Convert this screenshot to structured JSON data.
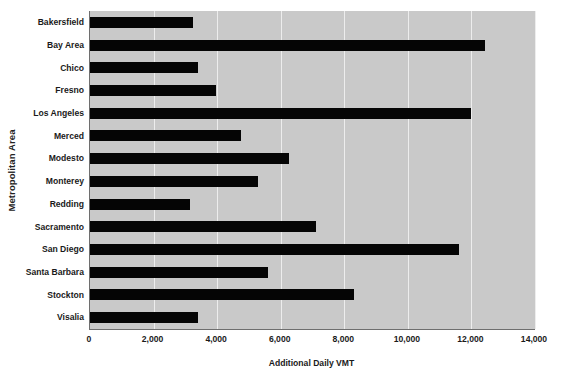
{
  "chart_data": {
    "type": "bar",
    "orientation": "horizontal",
    "title": "",
    "xlabel": "Additional Daily VMT",
    "ylabel": "Metropolitan Area",
    "xlim": [
      0,
      14000
    ],
    "xticks": [
      0,
      2000,
      4000,
      6000,
      8000,
      10000,
      12000,
      14000
    ],
    "xtick_labels": [
      "0",
      "2,000",
      "4,000",
      "6,000",
      "8,000",
      "10,000",
      "12,000",
      "14,000"
    ],
    "grid": true,
    "grid_axis": "x",
    "legend": false,
    "categories": [
      "Bakersfield",
      "Bay Area",
      "Chico",
      "Fresno",
      "Los Angeles",
      "Merced",
      "Modesto",
      "Monterey",
      "Redding",
      "Sacramento",
      "San Diego",
      "Santa Barbara",
      "Stockton",
      "Visalia"
    ],
    "values": [
      3240,
      12430,
      3400,
      3960,
      11980,
      4750,
      6250,
      5300,
      3150,
      7100,
      11620,
      5600,
      8300,
      3400
    ],
    "bar_color": "#050505",
    "plot_background": "#c9c9c9",
    "gridline_color": "#ededed",
    "axis_color": "#6e6e6e"
  }
}
